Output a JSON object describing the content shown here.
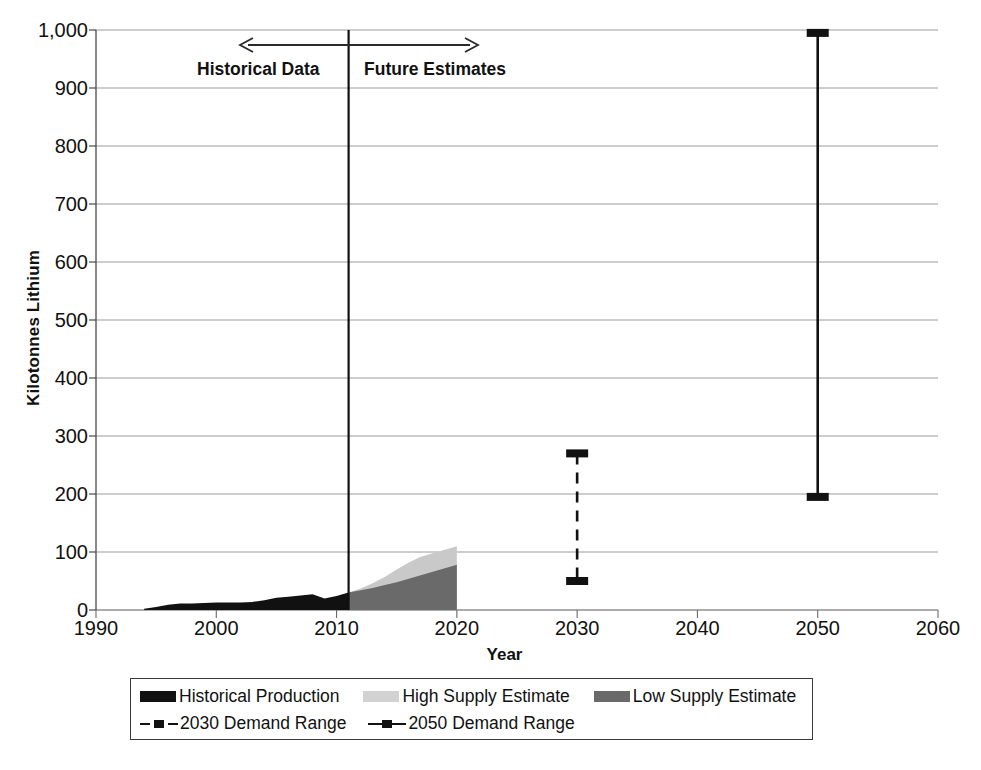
{
  "chart_data": {
    "type": "area",
    "title": "",
    "xlabel": "Year",
    "ylabel": "Kilotonnes Lithium",
    "xlim": [
      1990,
      2060
    ],
    "ylim": [
      0,
      1000
    ],
    "grid": true,
    "legend_position": "bottom",
    "xticks": [
      "1990",
      "2000",
      "2010",
      "2020",
      "2030",
      "2040",
      "2050",
      "2060"
    ],
    "yticks": [
      "0",
      "100",
      "200",
      "300",
      "400",
      "500",
      "600",
      "700",
      "800",
      "900",
      "1,000"
    ],
    "annotations": [
      {
        "name": "historical-data-label",
        "text": "Historical Data",
        "value": 1990
      },
      {
        "name": "future-estimates-label",
        "text": "Future Estimates",
        "value": 2011
      },
      {
        "name": "divider-year",
        "text": "2011",
        "value": 2011
      }
    ],
    "series": [
      {
        "name": "Historical Production",
        "type": "area",
        "color": "#111111",
        "x": [
          1994,
          1995,
          1996,
          1997,
          1998,
          1999,
          2000,
          2001,
          2002,
          2003,
          2004,
          2005,
          2006,
          2007,
          2008,
          2009,
          2010,
          2011
        ],
        "values": [
          2,
          5,
          9,
          11,
          11,
          12,
          13,
          13,
          13,
          14,
          17,
          21,
          23,
          25,
          27,
          20,
          24,
          30
        ]
      },
      {
        "name": "High Supply Estimate",
        "type": "area",
        "color": "#c9c9c9",
        "x": [
          2011,
          2012,
          2013,
          2014,
          2015,
          2016,
          2017,
          2018,
          2019,
          2020
        ],
        "values": [
          30,
          37,
          46,
          57,
          70,
          82,
          92,
          98,
          104,
          110
        ]
      },
      {
        "name": "Low Supply Estimate",
        "type": "area",
        "color": "#6a6a6a",
        "x": [
          2011,
          2012,
          2013,
          2014,
          2015,
          2016,
          2017,
          2018,
          2019,
          2020
        ],
        "values": [
          30,
          34,
          38,
          43,
          48,
          54,
          60,
          66,
          72,
          78
        ]
      },
      {
        "name": "2030 Demand Range",
        "type": "range",
        "style": "dashed",
        "color": "#111111",
        "x": 2030,
        "low": 50,
        "high": 270
      },
      {
        "name": "2050 Demand Range",
        "type": "range",
        "style": "solid",
        "color": "#111111",
        "x": 2050,
        "low": 195,
        "high": 995
      }
    ]
  },
  "axis": {
    "ylabel": "Kilotonnes Lithium",
    "xlabel": "Year",
    "yticks": [
      "1,000",
      "900",
      "800",
      "700",
      "600",
      "500",
      "400",
      "300",
      "200",
      "100",
      "0"
    ],
    "xticks": [
      "1990",
      "2000",
      "2010",
      "2020",
      "2030",
      "2040",
      "2050",
      "2060"
    ]
  },
  "annotations": {
    "historical": "Historical Data",
    "future": "Future Estimates"
  },
  "legend": {
    "row1": [
      {
        "label": "Historical Production",
        "swatch": "#111111",
        "kind": "swatch"
      },
      {
        "label": "High Supply Estimate",
        "swatch": "#d2d2d2",
        "kind": "swatch"
      },
      {
        "label": "Low Supply Estimate",
        "swatch": "#6a6a6a",
        "kind": "swatch"
      }
    ],
    "row2": [
      {
        "label": "2030 Demand Range",
        "swatch": "#111111",
        "kind": "dashed-line"
      },
      {
        "label": "2050 Demand Range",
        "swatch": "#111111",
        "kind": "solid-line"
      }
    ]
  }
}
